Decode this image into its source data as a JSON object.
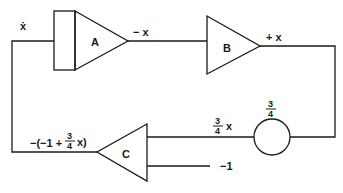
{
  "diagram": {
    "type": "analog computer block diagram",
    "blocks": [
      {
        "id": "A",
        "label": "A",
        "kind": "integrator"
      },
      {
        "id": "B",
        "label": "B",
        "kind": "inverter"
      },
      {
        "id": "C",
        "label": "C",
        "kind": "summer"
      },
      {
        "id": "K",
        "label": "",
        "kind": "coefficient potentiometer"
      }
    ],
    "signals": {
      "input_A": "ẋ",
      "output_A": "− x",
      "output_B": "+ x",
      "pot_coefficient_num": "3",
      "pot_coefficient_den": "4",
      "pot_output_num": "3",
      "pot_output_den": "4",
      "pot_output_var": "x",
      "c_extra_input": "−1",
      "output_C_prefix": "−(−1 +",
      "output_C_num": "3",
      "output_C_den": "4",
      "output_C_suffix": "x)"
    }
  }
}
